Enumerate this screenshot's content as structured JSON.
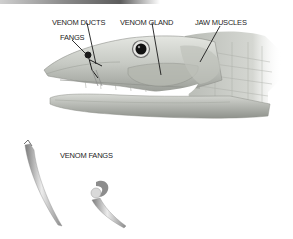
{
  "diagram": {
    "labels": {
      "venom_ducts": "VENOM DUCTS",
      "fangs": "FANGS",
      "venom_gland": "VENOM GLAND",
      "jaw_muscles": "JAW MUSCLES",
      "venom_fangs": "VENOM FANGS"
    },
    "colors": {
      "background": "#ffffff",
      "head_fill": "#c9ccc6",
      "head_shadow": "#8e918b",
      "gland_fill": "#b7bab2",
      "eye_ring": "#6d6d6d",
      "eye_pupil": "#111111",
      "leader_lines": "#1a1a1a",
      "fang_light": "#e6e6e6",
      "fang_dark": "#7b7b7b"
    }
  }
}
